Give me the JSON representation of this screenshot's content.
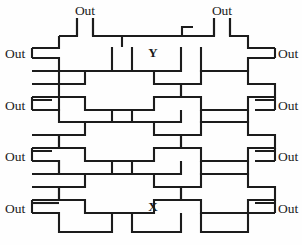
{
  "figure": {
    "name": "interdigitated-cross-lattice-diagram",
    "background_color": "#fefefe",
    "line_color": "#1c1c1c",
    "line_width_px": 2.1,
    "width_px": 302,
    "height_px": 245
  },
  "axis_labels": [
    {
      "id": "y-axis-label",
      "text": "Y",
      "x": 153,
      "y": 56,
      "role": "vertical-axis-designator"
    },
    {
      "id": "x-axis-label",
      "text": "X",
      "x": 153,
      "y": 209,
      "role": "horizontal-axis-designator"
    }
  ],
  "terminals": {
    "label_text": "Out",
    "top": [
      {
        "id": "out-top-1",
        "text": "Out",
        "x": 85,
        "y": 13,
        "stub_x": 85,
        "stub_y_from": 18,
        "stub_y_to": 37
      },
      {
        "id": "out-top-2",
        "text": "Out",
        "x": 222,
        "y": 13,
        "stub_x": 222,
        "stub_y_from": 18,
        "stub_y_to": 37
      }
    ],
    "left": [
      {
        "id": "out-left-1",
        "text": "Out",
        "x": 21,
        "y": 62,
        "stub_y": 59
      },
      {
        "id": "out-left-2",
        "text": "Out",
        "x": 21,
        "y": 113,
        "stub_y": 110
      },
      {
        "id": "out-left-3",
        "text": "Out",
        "x": 21,
        "y": 164,
        "stub_y": 161
      },
      {
        "id": "out-left-4",
        "text": "Out",
        "x": 21,
        "y": 213,
        "stub_y": 210
      }
    ],
    "right": [
      {
        "id": "out-right-1",
        "text": "Out",
        "x": 281,
        "y": 62,
        "stub_y": 59
      },
      {
        "id": "out-right-2",
        "text": "Out",
        "x": 281,
        "y": 113,
        "stub_y": 110
      },
      {
        "id": "out-right-3",
        "text": "Out",
        "x": 281,
        "y": 164,
        "stub_y": 161
      },
      {
        "id": "out-right-4",
        "text": "Out",
        "x": 281,
        "y": 213,
        "stub_y": 210
      }
    ]
  },
  "lattice": {
    "columns": 3,
    "rows": 3,
    "pitch_x_px": 69,
    "pitch_y_px": 51,
    "origin_x_px": 85,
    "origin_y_px": 59,
    "arm_half_width_px": 13,
    "cross_half_span_px": 27
  }
}
